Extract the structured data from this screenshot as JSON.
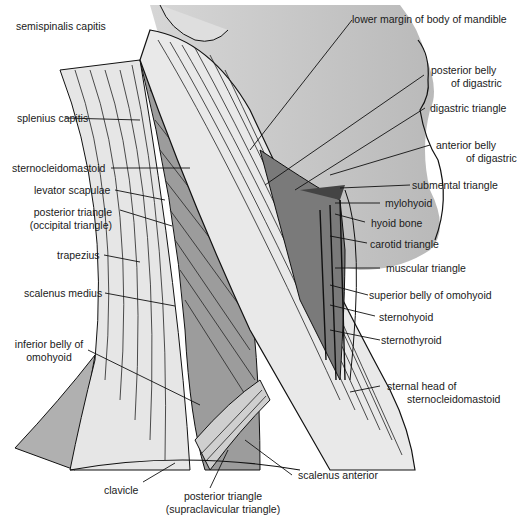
{
  "diagram": {
    "colors": {
      "background": "#ffffff",
      "skin": "#c9c9c9",
      "muscle_light": "#e4e4e4",
      "muscle_mid": "#a9a9a9",
      "muscle_dark": "#5a5a5a",
      "outline": "#111111"
    },
    "labels": {
      "semispinalis_capitis": "semispinalis capitis",
      "splenius_capitis": "splenius capitis",
      "sternocleidomastoid": "sternocleidomastoid",
      "levator_scapulae": "levator scapulae",
      "posterior_triangle_occ_1": "posterior triangle",
      "posterior_triangle_occ_2": "(occipital triangle)",
      "trapezius": "trapezius",
      "scalenus_medius": "scalenus medius",
      "inferior_belly_1": "inferior belly of",
      "inferior_belly_2": "omohyoid",
      "clavicle": "clavicle",
      "posterior_triangle_sup_1": "posterior triangle",
      "posterior_triangle_sup_2": "(supraclavicular triangle)",
      "scalenus_anterior": "scalenus anterior",
      "sternal_head_1": "sternal head of",
      "sternal_head_2": "sternocleidomastoid",
      "lower_margin": "lower margin of body of mandible",
      "posterior_belly_1": "posterior belly",
      "posterior_belly_2": "of digastric",
      "digastric_triangle": "digastric triangle",
      "anterior_belly_1": "anterior belly",
      "anterior_belly_2": "of digastric",
      "submental_triangle": "submental triangle",
      "mylohyoid": "mylohyoid",
      "hyoid_bone": "hyoid bone",
      "carotid_triangle": "carotid triangle",
      "muscular_triangle": "muscular triangle",
      "superior_belly_omohyoid": "superior belly of omohyoid",
      "sternohyoid": "sternohyoid",
      "sternothyroid": "sternothyroid"
    }
  }
}
